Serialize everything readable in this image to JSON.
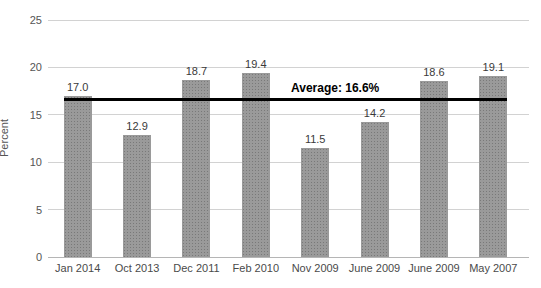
{
  "chart_data": {
    "type": "bar",
    "title": "",
    "xlabel": "",
    "ylabel": "Percent",
    "categories": [
      "Jan 2014",
      "Oct 2013",
      "Dec 2011",
      "Feb 2010",
      "Nov 2009",
      "June 2009",
      "June 2009",
      "May 2007"
    ],
    "values": [
      17.0,
      12.9,
      18.7,
      19.4,
      11.5,
      14.2,
      18.6,
      19.1
    ],
    "value_labels": [
      "17.0",
      "12.9",
      "18.7",
      "19.4",
      "11.5",
      "14.2",
      "18.6",
      "19.1"
    ],
    "ylim": [
      0,
      25
    ],
    "yticks": [
      0,
      5,
      10,
      15,
      20,
      25
    ],
    "grid": "horizontal",
    "legend": "none",
    "average_line": {
      "value": 16.6,
      "label": "Average: 16.6%"
    },
    "colors": {
      "bar": "#8f8f8f",
      "gridline": "#d2d2d2",
      "axis_line": "#b5b5b5",
      "average_line": "#000000",
      "label_text": "#3a3a3a",
      "tick_text": "#555555",
      "background": "#ffffff"
    }
  }
}
